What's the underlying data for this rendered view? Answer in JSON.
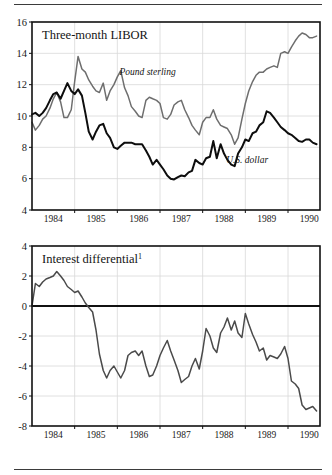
{
  "figure": {
    "background": "#ffffff",
    "top_rule": true,
    "bottom_rule": true
  },
  "chart_data": [
    {
      "type": "line",
      "title": "Three-month LIBOR",
      "xlabel": "",
      "ylabel": "",
      "ylim": [
        4,
        16
      ],
      "xlim": [
        1983.5,
        1990.25
      ],
      "yticks": [
        4,
        6,
        8,
        10,
        12,
        14,
        16
      ],
      "xticks": [
        1984,
        1985,
        1986,
        1987,
        1988,
        1989,
        1990
      ],
      "grid": true,
      "legend_position": "inline-annotation",
      "series": [
        {
          "name": "Pound sterling",
          "color": "#6e6e6e",
          "label_x": 1985.55,
          "label_y": 12.6,
          "x": [
            1983.5,
            1983.58,
            1983.67,
            1983.75,
            1983.83,
            1983.92,
            1984.0,
            1984.08,
            1984.17,
            1984.25,
            1984.33,
            1984.42,
            1984.5,
            1984.58,
            1984.67,
            1984.75,
            1984.83,
            1984.92,
            1985.0,
            1985.08,
            1985.17,
            1985.25,
            1985.33,
            1985.42,
            1985.5,
            1985.58,
            1985.67,
            1985.75,
            1985.83,
            1985.92,
            1986.0,
            1986.08,
            1986.17,
            1986.25,
            1986.33,
            1986.42,
            1986.5,
            1986.58,
            1986.67,
            1986.75,
            1986.83,
            1986.92,
            1987.0,
            1987.08,
            1987.17,
            1987.25,
            1987.33,
            1987.42,
            1987.5,
            1987.58,
            1987.67,
            1987.75,
            1987.83,
            1987.92,
            1988.0,
            1988.08,
            1988.17,
            1988.25,
            1988.33,
            1988.42,
            1988.5,
            1988.58,
            1988.67,
            1988.75,
            1988.83,
            1988.92,
            1989.0,
            1989.08,
            1989.17,
            1989.25,
            1989.33,
            1989.42,
            1989.5,
            1989.58,
            1989.67,
            1989.75,
            1989.83,
            1989.92,
            1990.0,
            1990.08,
            1990.17
          ],
          "y": [
            9.6,
            9.1,
            9.4,
            9.8,
            10.0,
            10.5,
            11.1,
            11.5,
            10.9,
            9.9,
            9.9,
            10.4,
            12.2,
            13.8,
            13.0,
            12.8,
            12.3,
            11.9,
            11.6,
            11.5,
            12.1,
            11.0,
            11.6,
            12.0,
            12.5,
            12.9,
            11.8,
            11.3,
            10.6,
            10.3,
            10.0,
            9.9,
            11.0,
            11.2,
            11.1,
            11.0,
            10.8,
            9.9,
            9.8,
            10.1,
            10.7,
            10.9,
            11.0,
            10.4,
            9.9,
            9.4,
            9.1,
            8.8,
            9.6,
            9.9,
            9.9,
            10.4,
            9.8,
            9.4,
            9.3,
            9.2,
            8.8,
            8.2,
            8.6,
            9.8,
            10.8,
            11.6,
            12.2,
            12.6,
            12.8,
            12.8,
            13.0,
            13.1,
            13.2,
            13.1,
            14.0,
            14.1,
            14.0,
            14.4,
            14.8,
            15.1,
            15.3,
            15.2,
            15.0,
            15.0,
            15.1
          ]
        },
        {
          "name": "U.S. dollar",
          "color": "#0d0d0d",
          "label_x": 1988.05,
          "label_y": 7.0,
          "x": [
            1983.5,
            1983.58,
            1983.67,
            1983.75,
            1983.83,
            1983.92,
            1984.0,
            1984.08,
            1984.17,
            1984.25,
            1984.33,
            1984.42,
            1984.5,
            1984.58,
            1984.67,
            1984.75,
            1984.83,
            1984.92,
            1985.0,
            1985.08,
            1985.17,
            1985.25,
            1985.33,
            1985.42,
            1985.5,
            1985.58,
            1985.67,
            1985.75,
            1985.83,
            1985.92,
            1986.0,
            1986.08,
            1986.17,
            1986.25,
            1986.33,
            1986.42,
            1986.5,
            1986.58,
            1986.67,
            1986.75,
            1986.83,
            1986.92,
            1987.0,
            1987.08,
            1987.17,
            1987.25,
            1987.33,
            1987.42,
            1987.5,
            1987.58,
            1987.67,
            1987.75,
            1987.83,
            1987.92,
            1988.0,
            1988.08,
            1988.17,
            1988.25,
            1988.33,
            1988.42,
            1988.5,
            1988.58,
            1988.67,
            1988.75,
            1988.83,
            1988.92,
            1989.0,
            1989.08,
            1989.17,
            1989.25,
            1989.33,
            1989.42,
            1989.5,
            1989.58,
            1989.67,
            1989.75,
            1989.83,
            1989.92,
            1990.0,
            1990.08,
            1990.17
          ],
          "y": [
            10.1,
            10.2,
            10.0,
            10.2,
            10.5,
            11.0,
            11.4,
            11.5,
            11.1,
            11.6,
            12.1,
            11.6,
            11.4,
            11.7,
            11.3,
            10.2,
            9.0,
            8.5,
            9.0,
            9.4,
            9.5,
            8.9,
            8.6,
            8.0,
            7.9,
            8.1,
            8.3,
            8.3,
            8.3,
            8.2,
            8.2,
            8.2,
            7.8,
            7.4,
            6.9,
            7.2,
            6.9,
            6.6,
            6.2,
            6.0,
            5.95,
            6.1,
            6.2,
            6.15,
            6.4,
            6.5,
            7.2,
            7.0,
            6.9,
            7.3,
            7.4,
            8.4,
            7.3,
            8.2,
            7.6,
            7.2,
            6.9,
            6.8,
            7.6,
            8.0,
            8.5,
            8.4,
            8.9,
            9.0,
            9.4,
            9.6,
            10.3,
            10.2,
            9.9,
            9.6,
            9.3,
            9.1,
            8.9,
            8.8,
            8.6,
            8.4,
            8.35,
            8.5,
            8.5,
            8.3,
            8.2
          ]
        }
      ]
    },
    {
      "type": "line",
      "title": "Interest differential",
      "title_superscript": "1",
      "xlabel": "",
      "ylabel": "",
      "ylim": [
        -8,
        4
      ],
      "xlim": [
        1983.5,
        1990.25
      ],
      "yticks": [
        4,
        2,
        0,
        -2,
        -4,
        -6,
        -8
      ],
      "xticks": [
        1984,
        1985,
        1986,
        1987,
        1988,
        1989,
        1990
      ],
      "grid": true,
      "zero_line": true,
      "series": [
        {
          "name": "Interest differential",
          "color": "#4a4a4a",
          "x": [
            1983.5,
            1983.58,
            1983.67,
            1983.75,
            1983.83,
            1983.92,
            1984.0,
            1984.08,
            1984.17,
            1984.25,
            1984.33,
            1984.42,
            1984.5,
            1984.58,
            1984.67,
            1984.75,
            1984.83,
            1984.92,
            1985.0,
            1985.08,
            1985.17,
            1985.25,
            1985.33,
            1985.42,
            1985.5,
            1985.58,
            1985.67,
            1985.75,
            1985.83,
            1985.92,
            1986.0,
            1986.08,
            1986.17,
            1986.25,
            1986.33,
            1986.42,
            1986.5,
            1986.58,
            1986.67,
            1986.75,
            1986.83,
            1986.92,
            1987.0,
            1987.08,
            1987.17,
            1987.25,
            1987.33,
            1987.42,
            1987.5,
            1987.58,
            1987.67,
            1987.75,
            1987.83,
            1987.92,
            1988.0,
            1988.08,
            1988.17,
            1988.25,
            1988.33,
            1988.42,
            1988.5,
            1988.58,
            1988.67,
            1988.75,
            1988.83,
            1988.92,
            1989.0,
            1989.08,
            1989.17,
            1989.25,
            1989.33,
            1989.42,
            1989.5,
            1989.58,
            1989.67,
            1989.75,
            1989.83,
            1989.92,
            1990.0,
            1990.08,
            1990.17
          ],
          "y": [
            0.0,
            1.5,
            1.3,
            1.6,
            1.8,
            1.9,
            2.0,
            2.3,
            2.0,
            1.7,
            1.3,
            1.1,
            0.9,
            1.0,
            0.6,
            0.2,
            -0.1,
            -0.4,
            -1.6,
            -3.2,
            -4.3,
            -4.8,
            -4.3,
            -4.0,
            -4.4,
            -4.8,
            -4.3,
            -3.3,
            -3.1,
            -3.0,
            -3.3,
            -3.0,
            -4.0,
            -4.7,
            -4.6,
            -4.0,
            -3.3,
            -2.8,
            -2.3,
            -3.0,
            -3.6,
            -4.3,
            -5.1,
            -4.9,
            -4.7,
            -4.0,
            -3.5,
            -4.2,
            -3.0,
            -1.5,
            -2.0,
            -2.8,
            -3.1,
            -1.8,
            -1.4,
            -0.8,
            -1.6,
            -1.0,
            -1.8,
            -2.1,
            -0.5,
            -1.2,
            -1.9,
            -2.4,
            -3.0,
            -2.8,
            -3.6,
            -3.3,
            -3.4,
            -3.5,
            -3.2,
            -2.7,
            -3.5,
            -5.0,
            -5.2,
            -5.5,
            -6.6,
            -6.9,
            -6.8,
            -6.7,
            -7.0
          ]
        }
      ]
    }
  ]
}
